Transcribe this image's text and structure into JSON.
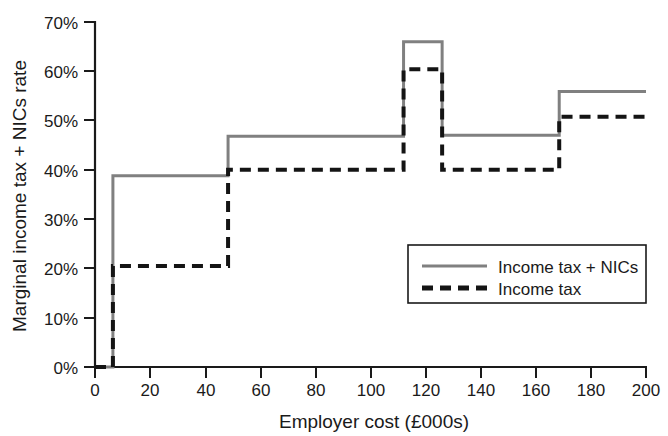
{
  "chart_data": {
    "type": "line",
    "title": "",
    "subtitle": "",
    "xlabel": "Employer cost (£000s)",
    "ylabel": "Marginal income tax + NICs rate",
    "xlim": [
      0,
      200
    ],
    "ylim": [
      0,
      70
    ],
    "grid": false,
    "step_style": "post",
    "x_ticks": [
      0,
      20,
      40,
      60,
      80,
      100,
      120,
      140,
      160,
      180,
      200
    ],
    "x_tick_labels": [
      "0",
      "20",
      "40",
      "60",
      "80",
      "100",
      "120",
      "140",
      "160",
      "180",
      "200"
    ],
    "y_ticks": [
      0,
      10,
      20,
      30,
      40,
      50,
      60,
      70
    ],
    "y_tick_labels": [
      "0%",
      "10%",
      "20%",
      "30%",
      "40%",
      "50%",
      "60%",
      "70%"
    ],
    "legend_position": "center-right",
    "series": [
      {
        "name": "Income tax + NICs",
        "color": "#808080",
        "style": "solid",
        "x": [
          0,
          6.5,
          48.3,
          112.0,
          126.0,
          168.5,
          200
        ],
        "values": [
          0,
          38.8,
          46.8,
          66.0,
          47.0,
          55.9,
          55.9
        ],
        "breakpoints": [
          {
            "x": 6.5,
            "from": 0,
            "to": 38.8
          },
          {
            "x": 48.3,
            "from": 38.8,
            "to": 46.8
          },
          {
            "x": 112.0,
            "from": 46.8,
            "to": 66.0
          },
          {
            "x": 126.0,
            "from": 66.0,
            "to": 47.0
          },
          {
            "x": 168.5,
            "from": 47.0,
            "to": 55.9
          }
        ]
      },
      {
        "name": "Income tax",
        "color": "#141414",
        "style": "dashed",
        "x": [
          0,
          6.5,
          48.3,
          112.0,
          126.0,
          168.5,
          200
        ],
        "values": [
          0,
          20.5,
          40.0,
          60.4,
          40.0,
          50.8,
          50.8
        ],
        "breakpoints": [
          {
            "x": 6.5,
            "from": 0,
            "to": 20.5
          },
          {
            "x": 48.3,
            "from": 20.5,
            "to": 40.0
          },
          {
            "x": 112.0,
            "from": 40.0,
            "to": 60.4
          },
          {
            "x": 126.0,
            "from": 60.4,
            "to": 40.0
          },
          {
            "x": 168.5,
            "from": 40.0,
            "to": 50.8
          }
        ]
      }
    ]
  },
  "legend": {
    "entries": [
      {
        "label": "Income tax + NICs",
        "swatch": "solid-line-swatch"
      },
      {
        "label": "Income tax",
        "swatch": "dashed-line-swatch"
      }
    ]
  },
  "axes": {
    "y_label": "Marginal income tax + NICs rate",
    "x_label": "Employer cost (£000s)",
    "y_tick_labels": [
      "70%",
      "60%",
      "50%",
      "40%",
      "30%",
      "20%",
      "10%",
      "0%"
    ],
    "x_tick_labels": [
      "0",
      "20",
      "40",
      "60",
      "80",
      "100",
      "120",
      "140",
      "160",
      "180",
      "200"
    ]
  },
  "colors": {
    "background": "#ffffff",
    "axis": "#1a1a1a",
    "series_income_tax_nics": "#808080",
    "series_income_tax": "#141414"
  }
}
